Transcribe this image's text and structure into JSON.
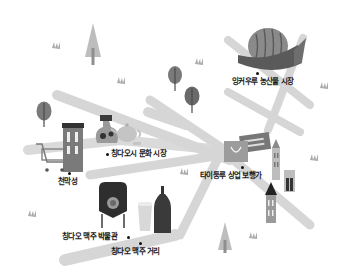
{
  "map": {
    "colors": {
      "road": "#d6d6d6",
      "icon_dark": "#3a3a3a",
      "icon_mid": "#8a8a8a",
      "icon_light": "#bdbdbd",
      "label": "#1a1a1a"
    },
    "locations": [
      {
        "id": "market",
        "label": "잉커우루 농산물 시장",
        "icon": "watermelon-icon"
      },
      {
        "id": "culture_market",
        "label": "칭다오시 문화 시장",
        "icon": "teapot-vase-icon"
      },
      {
        "id": "tianmu",
        "label": "천막성",
        "icon": "shopping-cart-building-icon"
      },
      {
        "id": "taidong",
        "label": "타이둥루 상업 보행가",
        "icon": "shopping-bag-icon"
      },
      {
        "id": "beer_museum",
        "label": "칭다오 맥주 박물관",
        "icon": "brewing-tank-icon"
      },
      {
        "id": "beer_street",
        "label": "칭다오 맥주 거리",
        "icon": "beer-bottle-icon"
      }
    ]
  }
}
